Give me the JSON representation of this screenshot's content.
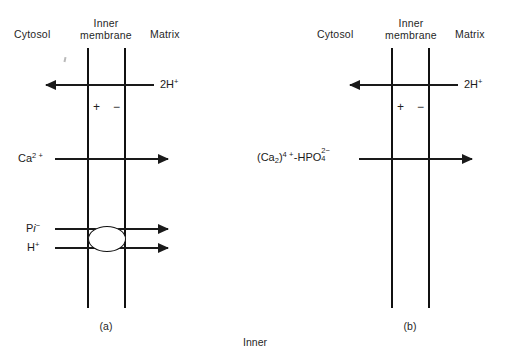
{
  "figure": {
    "bottom_caption": "Inner",
    "panels": [
      {
        "id": "a",
        "caption": "(a)",
        "headers": {
          "cytosol": "Cytosol",
          "membrane_line1": "Inner",
          "membrane_line2": "membrane",
          "matrix": "Matrix"
        },
        "charges": {
          "outer": "+",
          "inner": "−"
        },
        "transports": [
          {
            "name": "proton-efflux",
            "label_html": "2H<sup>+</sup>",
            "label_text": "2H+",
            "direction": "left",
            "label_side": "right"
          },
          {
            "name": "calcium-uptake",
            "label_html": "Ca<sup>2 +</sup>",
            "label_text": "Ca2+",
            "direction": "right",
            "label_side": "left"
          },
          {
            "name": "phosphate-uptake",
            "label_html": "P<span class=\"it\">i</span><sup>−</sup>",
            "label_text": "Pi-",
            "direction": "right",
            "label_side": "left"
          },
          {
            "name": "proton-uptake",
            "label_html": "H<sup>+</sup>",
            "label_text": "H+",
            "direction": "right",
            "label_side": "left"
          }
        ],
        "transporter_shape": "oval"
      },
      {
        "id": "b",
        "caption": "(b)",
        "headers": {
          "cytosol": "Cytosol",
          "membrane_line1": "Inner",
          "membrane_line2": "membrane",
          "matrix": "Matrix"
        },
        "charges": {
          "outer": "+",
          "inner": "−"
        },
        "transports": [
          {
            "name": "proton-efflux",
            "label_html": "2H<sup>+</sup>",
            "label_text": "2H+",
            "direction": "left",
            "label_side": "right"
          },
          {
            "name": "calcium-phosphate-complex-uptake",
            "label_html": "(Ca<sub>2</sub>)<sup>4 +</sup>-HPO<span class=\"stack\"><span class=\"sup\">2&#8722;</span><span class=\"sub\">4</span></span>",
            "label_text": "(Ca2)4+-HPO4 2-",
            "direction": "right",
            "label_side": "left"
          }
        ],
        "transporter_shape": "none"
      }
    ]
  },
  "colors": {
    "ink": "#1a1a1a",
    "line": "#111111",
    "background": "#ffffff"
  }
}
